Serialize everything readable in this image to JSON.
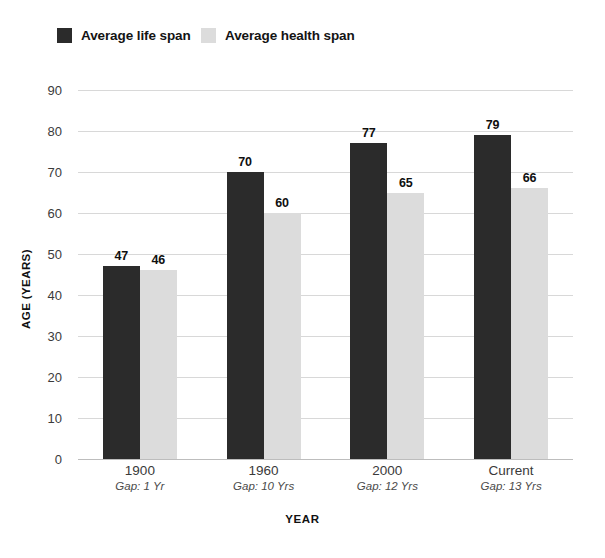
{
  "chart_data": {
    "type": "bar",
    "title": "",
    "xlabel": "YEAR",
    "ylabel": "AGE (YEARS)",
    "categories": [
      "1900",
      "1960",
      "2000",
      "Current"
    ],
    "category_sublabels": [
      "Gap: 1 Yr",
      "Gap: 10 Yrs",
      "Gap: 12 Yrs",
      "Gap: 13 Yrs"
    ],
    "series": [
      {
        "name": "Average life span",
        "color": "#2b2b2b",
        "values": [
          47,
          70,
          77,
          79
        ]
      },
      {
        "name": "Average health span",
        "color": "#dcdcdc",
        "values": [
          46,
          60,
          65,
          66
        ]
      }
    ],
    "yticks": [
      0,
      10,
      20,
      30,
      40,
      50,
      60,
      70,
      80,
      90
    ],
    "ylim": [
      0,
      90
    ],
    "grid": true,
    "legend_position": "top-left",
    "show_data_labels": true
  },
  "legend": {
    "items": [
      {
        "label": "Average life span",
        "swatch": "dark-swatch"
      },
      {
        "label": "Average health span",
        "swatch": "light-swatch"
      }
    ]
  },
  "axes": {
    "y_title": "AGE (YEARS)",
    "x_title": "YEAR"
  },
  "colors": {
    "life_span": "#2b2b2b",
    "health_span": "#dcdcdc",
    "gridline": "#d8d8d8",
    "baseline": "#bdbdbd",
    "text": "#1a1a1a",
    "background": "#ffffff"
  }
}
